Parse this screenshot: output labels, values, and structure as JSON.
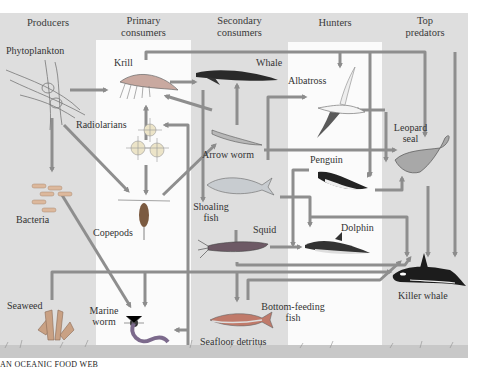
{
  "diagram": {
    "caption": "AN OCEANIC FOOD WEB",
    "columns": [
      {
        "id": "producers",
        "label": "Producers"
      },
      {
        "id": "primary",
        "label": "Primary consumers",
        "line1": "Primary",
        "line2": "consumers"
      },
      {
        "id": "secondary",
        "label": "Secondary consumers",
        "line1": "Secondary",
        "line2": "consumers"
      },
      {
        "id": "hunters",
        "label": "Hunters"
      },
      {
        "id": "top",
        "label": "Top predators",
        "line1": "Top",
        "line2": "predators"
      }
    ],
    "organisms": {
      "phytoplankton": {
        "label": "Phytoplankton",
        "column": "producers"
      },
      "bacteria": {
        "label": "Bacteria",
        "column": "producers"
      },
      "seaweed": {
        "label": "Seaweed",
        "column": "producers"
      },
      "krill": {
        "label": "Krill",
        "column": "primary"
      },
      "radiolarians": {
        "label": "Radiolarians",
        "column": "primary"
      },
      "copepods": {
        "label": "Copepods",
        "column": "primary"
      },
      "marine_worm": {
        "label": "Marine worm",
        "line1": "Marine",
        "line2": "worm",
        "column": "primary"
      },
      "whale": {
        "label": "Whale",
        "column": "secondary"
      },
      "arrow_worm": {
        "label": "Arrow worm",
        "column": "secondary"
      },
      "shoaling_fish": {
        "label": "Shoaling fish",
        "line1": "Shoaling",
        "line2": "fish",
        "column": "secondary"
      },
      "squid": {
        "label": "Squid",
        "column": "secondary"
      },
      "bottom_fish": {
        "label": "Bottom-feeding fish",
        "line1": "Bottom-feeding",
        "line2": "fish",
        "column": "secondary"
      },
      "seafloor_detritus": {
        "label": "Seafloor detritus",
        "column": "secondary"
      },
      "albatross": {
        "label": "Albatross",
        "column": "hunters"
      },
      "penguin": {
        "label": "Penguin",
        "column": "hunters"
      },
      "dolphin": {
        "label": "Dolphin",
        "column": "hunters"
      },
      "leopard_seal": {
        "label": "Leopard seal",
        "line1": "Leopard",
        "line2": "seal",
        "column": "top"
      },
      "killer_whale": {
        "label": "Killer whale",
        "column": "top"
      }
    },
    "feeding_links": [
      {
        "from": "phytoplankton",
        "to": "krill"
      },
      {
        "from": "phytoplankton",
        "to": "bacteria"
      },
      {
        "from": "phytoplankton",
        "to": "copepods"
      },
      {
        "from": "radiolarians",
        "to": "krill"
      },
      {
        "from": "radiolarians",
        "to": "copepods"
      },
      {
        "from": "krill",
        "to": "whale"
      },
      {
        "from": "krill",
        "to": "leopard_seal"
      },
      {
        "from": "krill",
        "to": "albatross"
      },
      {
        "from": "copepods",
        "to": "arrow_worm"
      },
      {
        "from": "copepods",
        "to": "whale"
      },
      {
        "from": "arrow_worm",
        "to": "whale"
      },
      {
        "from": "arrow_worm",
        "to": "leopard_seal"
      },
      {
        "from": "shoaling_fish",
        "to": "albatross"
      },
      {
        "from": "shoaling_fish",
        "to": "penguin"
      },
      {
        "from": "shoaling_fish",
        "to": "squid"
      },
      {
        "from": "shoaling_fish",
        "to": "dolphin"
      },
      {
        "from": "squid",
        "to": "dolphin"
      },
      {
        "from": "squid",
        "to": "killer_whale"
      },
      {
        "from": "squid",
        "to": "bottom_fish"
      },
      {
        "from": "penguin",
        "to": "leopard_seal"
      },
      {
        "from": "dolphin",
        "to": "killer_whale"
      },
      {
        "from": "leopard_seal",
        "to": "killer_whale"
      },
      {
        "from": "bacteria",
        "to": "marine_worm"
      },
      {
        "from": "seaweed",
        "to": "marine_worm"
      },
      {
        "from": "seaweed",
        "to": "bottom_fish"
      },
      {
        "from": "seafloor_detritus",
        "to": "marine_worm"
      },
      {
        "from": "bottom_fish",
        "to": "killer_whale"
      }
    ],
    "colors": {
      "band_gray": "#dcdcdc",
      "band_white": "#ffffff",
      "arrow": "#8c8c8c",
      "seafloor": "#c9c9c9"
    }
  }
}
